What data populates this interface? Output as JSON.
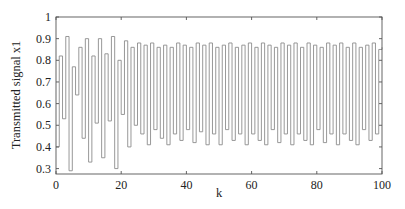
{
  "chart_data": {
    "type": "line",
    "style": "stairs",
    "title": "",
    "xlabel": "k",
    "ylabel": "Transmitted signal x1",
    "xlim": [
      0,
      100
    ],
    "ylim": [
      0.275,
      1.0
    ],
    "xticks": [
      0,
      20,
      40,
      60,
      80,
      100
    ],
    "yticks": [
      0.3,
      0.4,
      0.5,
      0.6,
      0.7,
      0.8,
      0.9,
      1
    ],
    "ytick_labels": [
      "0.3",
      "0.4",
      "0.5",
      "0.6",
      "0.7",
      "0.8",
      "0.9",
      "1"
    ],
    "xtick_labels": [
      "0",
      "20",
      "40",
      "60",
      "80",
      "100"
    ],
    "grid": false,
    "legend": null,
    "line_color": "#8c8c8c",
    "series": [
      {
        "name": "x1",
        "x": [
          0,
          1,
          2,
          3,
          4,
          5,
          6,
          7,
          8,
          9,
          10,
          11,
          12,
          13,
          14,
          15,
          16,
          17,
          18,
          19,
          20,
          21,
          22,
          23,
          24,
          25,
          26,
          27,
          28,
          29,
          30,
          31,
          32,
          33,
          34,
          35,
          36,
          37,
          38,
          39,
          40,
          41,
          42,
          43,
          44,
          45,
          46,
          47,
          48,
          49,
          50,
          51,
          52,
          53,
          54,
          55,
          56,
          57,
          58,
          59,
          60,
          61,
          62,
          63,
          64,
          65,
          66,
          67,
          68,
          69,
          70,
          71,
          72,
          73,
          74,
          75,
          76,
          77,
          78,
          79,
          80,
          81,
          82,
          83,
          84,
          85,
          86,
          87,
          88,
          89,
          90,
          91,
          92,
          93,
          94,
          95,
          96,
          97,
          98,
          99,
          100
        ],
        "values": [
          0.4,
          0.82,
          0.53,
          0.91,
          0.29,
          0.77,
          0.64,
          0.86,
          0.44,
          0.9,
          0.33,
          0.82,
          0.51,
          0.9,
          0.35,
          0.83,
          0.52,
          0.91,
          0.3,
          0.8,
          0.55,
          0.89,
          0.4,
          0.86,
          0.5,
          0.88,
          0.46,
          0.87,
          0.41,
          0.88,
          0.48,
          0.86,
          0.44,
          0.87,
          0.41,
          0.86,
          0.46,
          0.88,
          0.43,
          0.87,
          0.48,
          0.86,
          0.42,
          0.88,
          0.47,
          0.87,
          0.41,
          0.88,
          0.46,
          0.86,
          0.41,
          0.87,
          0.48,
          0.88,
          0.43,
          0.86,
          0.46,
          0.87,
          0.41,
          0.88,
          0.46,
          0.86,
          0.43,
          0.88,
          0.41,
          0.87,
          0.48,
          0.86,
          0.42,
          0.88,
          0.46,
          0.87,
          0.41,
          0.88,
          0.46,
          0.86,
          0.43,
          0.88,
          0.41,
          0.87,
          0.48,
          0.86,
          0.42,
          0.88,
          0.46,
          0.87,
          0.41,
          0.88,
          0.46,
          0.86,
          0.43,
          0.88,
          0.41,
          0.86,
          0.48,
          0.87,
          0.43,
          0.88,
          0.46,
          0.85,
          0.86
        ]
      }
    ]
  }
}
